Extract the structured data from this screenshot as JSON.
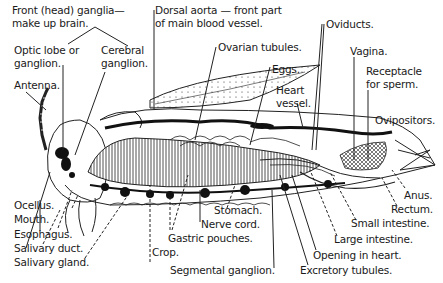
{
  "diagram": {
    "labels": {
      "front_ganglia_1": "Front (head) ganglia—",
      "front_ganglia_2": "make up brain.",
      "optic_lobe_1": "Optic lobe or",
      "optic_lobe_2": "ganglion.",
      "cerebral_1": "Cerebral",
      "cerebral_2": "ganglion.",
      "antenna": "Antenna.",
      "dorsal_aorta_1": "Dorsal aorta — front part",
      "dorsal_aorta_2": "of main blood vessel.",
      "ovarian_tubules": "Ovarian tubules.",
      "eggs": "Eggs.",
      "heart_vessel_1": "Heart",
      "heart_vessel_2": "vessel.",
      "oviducts": "Oviducts.",
      "vagina": "Vagina.",
      "receptacle_1": "Receptacle",
      "receptacle_2": "for sperm.",
      "ovipositors": "Ovipositors.",
      "ocellus": "Ocellus.",
      "mouth": "Mouth.",
      "esophagus": "Esophagus.",
      "salivary_duct": "Salivary duct.",
      "salivary_gland": "Salivary gland.",
      "crop": "Crop.",
      "gastric_pouches": "Gastric pouches.",
      "nerve_cord": "Nerve cord.",
      "stomach": "Stomach.",
      "segmental_ganglion": "Segmental ganglion.",
      "excretory_tubules": "Excretory tubules.",
      "opening_in_heart": "Opening in heart.",
      "large_intestine": "Large intestine.",
      "small_intestine": "Small intestine.",
      "rectum": "Rectum.",
      "anus": "Anus."
    },
    "colors": {
      "ink": "#1a1a1a",
      "background": "#ffffff",
      "shade": "#cfcfcf"
    }
  }
}
